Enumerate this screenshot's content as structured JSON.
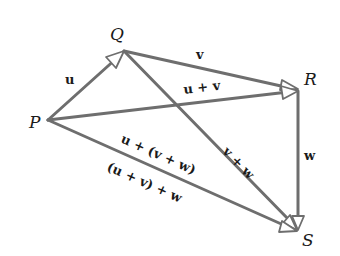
{
  "diagram": {
    "points": {
      "P": {
        "label": "P",
        "x": 48,
        "y": 120
      },
      "Q": {
        "label": "Q",
        "x": 124,
        "y": 51
      },
      "R": {
        "label": "R",
        "x": 298,
        "y": 91
      },
      "S": {
        "label": "S",
        "x": 297,
        "y": 230
      }
    },
    "vectors": [
      {
        "id": "u",
        "from": "P",
        "to": "Q",
        "label": "u"
      },
      {
        "id": "v",
        "from": "Q",
        "to": "R",
        "label": "v"
      },
      {
        "id": "w",
        "from": "R",
        "to": "S",
        "label": "w"
      },
      {
        "id": "u_plus_v",
        "from": "P",
        "to": "R",
        "label": "u + v"
      },
      {
        "id": "v_plus_w",
        "from": "Q",
        "to": "S",
        "label": "v + w"
      },
      {
        "id": "u_plus_vw",
        "from": "P",
        "to": "S",
        "label": "u + (v + w)"
      },
      {
        "id": "uv_plus_w",
        "from": "P",
        "to": "S",
        "label": "(u + v) + w"
      }
    ],
    "colors": {
      "line": "#6e6e6e",
      "text": "#1a1a1a",
      "background": "#ffffff"
    }
  }
}
